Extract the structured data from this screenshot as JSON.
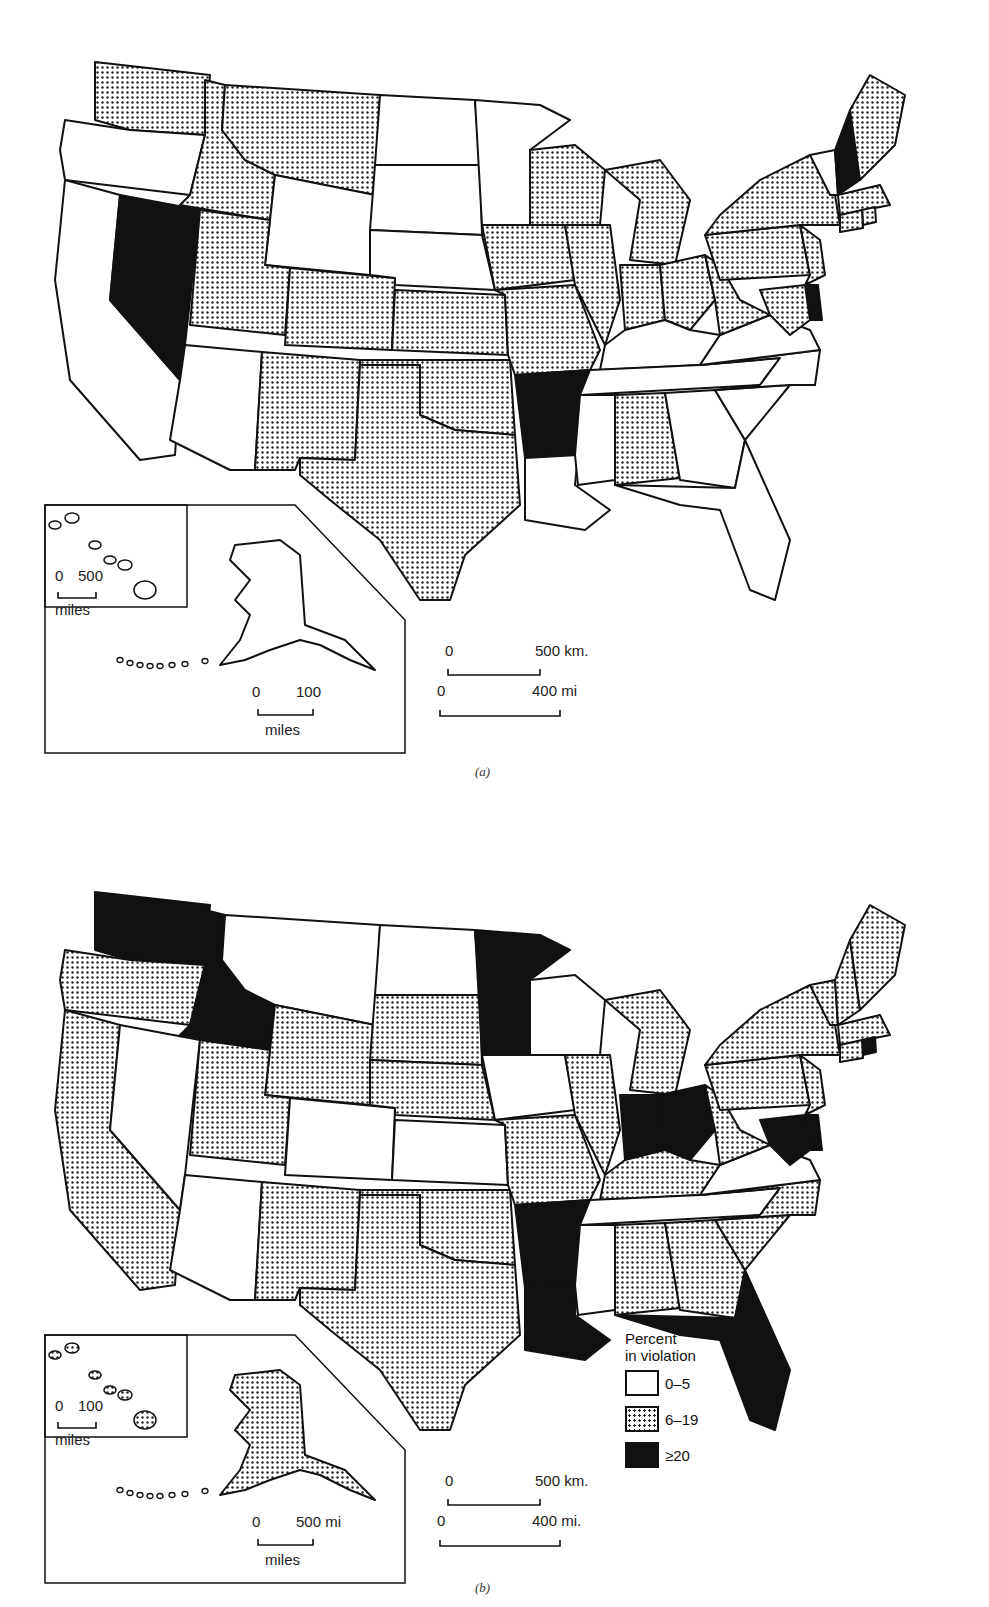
{
  "figure": {
    "panels": [
      {
        "id": "a",
        "caption": "(a)",
        "scale_bars": {
          "main_km": {
            "zero": "0",
            "end": "500 km."
          },
          "main_mi": {
            "zero": "0",
            "end": "400 mi"
          },
          "alaska": {
            "zero": "0",
            "end": "100",
            "unit": "miles"
          },
          "hawaii": {
            "zero": "0",
            "end": "500",
            "unit": "miles"
          }
        }
      },
      {
        "id": "b",
        "caption": "(b)",
        "scale_bars": {
          "main_km": {
            "zero": "0",
            "end": "500 km."
          },
          "main_mi": {
            "zero": "0",
            "end": "400 mi."
          },
          "alaska": {
            "zero": "0",
            "end": "500 mi",
            "unit": "miles"
          },
          "hawaii": {
            "zero": "0",
            "end": "100",
            "unit": "miles"
          }
        }
      }
    ],
    "legend": {
      "title_line1": "Percent",
      "title_line2": "in violation",
      "items": [
        {
          "key": "low",
          "label": "0–5"
        },
        {
          "key": "mid",
          "label": "6–19"
        },
        {
          "key": "high",
          "label": "≥20"
        }
      ]
    }
  },
  "colors": {
    "low": "#ffffff",
    "mid": "dotted",
    "high": "#111111",
    "outline": "#111111"
  },
  "map_data": {
    "a": {
      "WA": "mid",
      "OR": "low",
      "CA": "low",
      "NV": "high",
      "ID": "mid",
      "MT": "mid",
      "WY": "low",
      "UT": "mid",
      "CO": "mid",
      "AZ": "low",
      "NM": "mid",
      "ND": "low",
      "SD": "low",
      "NE": "low",
      "KS": "mid",
      "OK": "mid",
      "TX": "mid",
      "MN": "low",
      "IA": "mid",
      "MO": "mid",
      "AR": "high",
      "LA": "low",
      "WI": "mid",
      "IL": "mid",
      "MI": "mid",
      "IN": "mid",
      "OH": "mid",
      "KY": "low",
      "TN": "low",
      "MS": "low",
      "AL": "mid",
      "GA": "low",
      "FL": "low",
      "SC": "low",
      "NC": "low",
      "VA": "low",
      "WV": "mid",
      "PA": "mid",
      "NY": "mid",
      "VT": "low",
      "NH": "high",
      "ME": "mid",
      "MA": "mid",
      "RI": "mid",
      "CT": "mid",
      "NJ": "mid",
      "DE": "high",
      "MD": "mid",
      "AK": "low",
      "HI": "low"
    },
    "b": {
      "WA": "high",
      "OR": "mid",
      "CA": "mid",
      "NV": "low",
      "ID": "high",
      "MT": "low",
      "WY": "mid",
      "UT": "mid",
      "CO": "low",
      "AZ": "low",
      "NM": "mid",
      "ND": "low",
      "SD": "mid",
      "NE": "mid",
      "KS": "low",
      "OK": "mid",
      "TX": "mid",
      "MN": "high",
      "IA": "low",
      "MO": "mid",
      "AR": "high",
      "LA": "high",
      "WI": "low",
      "IL": "mid",
      "MI": "mid",
      "IN": "high",
      "OH": "high",
      "KY": "mid",
      "TN": "low",
      "MS": "low",
      "AL": "mid",
      "GA": "mid",
      "FL": "high",
      "SC": "mid",
      "NC": "mid",
      "VA": "low",
      "WV": "mid",
      "PA": "mid",
      "NY": "mid",
      "VT": "mid",
      "NH": "mid",
      "ME": "mid",
      "MA": "mid",
      "RI": "high",
      "CT": "mid",
      "NJ": "mid",
      "DE": "high",
      "MD": "high",
      "AK": "mid",
      "HI": "mid"
    }
  }
}
